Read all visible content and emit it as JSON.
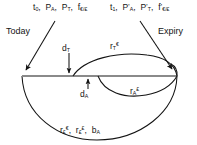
{
  "diagram": {
    "stroke_color": "#141414",
    "background_color": "#ffffff",
    "timeline": {
      "start_label": "Today",
      "end_label": "Expiry"
    },
    "labels": {
      "top_left": {
        "parts": [
          {
            "base": "t",
            "sub": "0"
          },
          {
            "base": "P",
            "sub": "A"
          },
          {
            "base": "P",
            "sub": "T"
          },
          {
            "base": "f",
            "sub": "€/£"
          }
        ],
        "text": "t0, PA, PT, f€/£"
      },
      "top_right": {
        "parts": [
          {
            "base": "t",
            "sub": "1"
          },
          {
            "base": "P",
            "prime": true,
            "sub": "A"
          },
          {
            "base": "P",
            "prime": true,
            "sub": "T"
          },
          {
            "base": "f",
            "prime": true,
            "sub": "€/£"
          }
        ],
        "text": "t1, P'A, P'T, f'€/£"
      },
      "d_t": {
        "base": "d",
        "sub": "T",
        "sup": ""
      },
      "r_t": {
        "base": "r",
        "sub": "T",
        "sup": "€"
      },
      "d_a": {
        "base": "d",
        "sub": "A",
        "sup": ""
      },
      "r_a": {
        "base": "r",
        "sub": "A",
        "sup": "£"
      },
      "bottom": {
        "parts": [
          {
            "base": "r",
            "sub": "£",
            "sup": "€"
          },
          {
            "base": "r",
            "sub": "£",
            "sup": "£"
          },
          {
            "base": "b",
            "sub": "A",
            "sup": ""
          }
        ],
        "text": "r£€, r££, bA"
      }
    }
  }
}
